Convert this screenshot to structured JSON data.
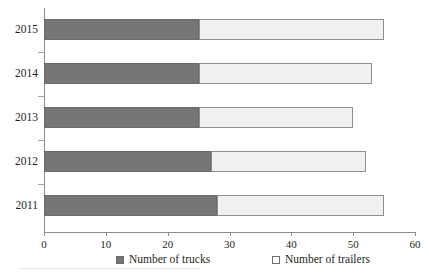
{
  "chart_data": {
    "type": "bar",
    "orientation": "horizontal",
    "stacked": true,
    "title": "",
    "xlabel": "",
    "ylabel": "",
    "categories": [
      "2015",
      "2014",
      "2013",
      "2012",
      "2011"
    ],
    "series": [
      {
        "name": "Number of trucks",
        "values": [
          25,
          25,
          25,
          27,
          28
        ],
        "color": "#767676"
      },
      {
        "name": "Number of trailers",
        "values": [
          30,
          28,
          25,
          25,
          27
        ],
        "color": "#f0f0f0"
      }
    ],
    "totals": [
      55,
      53,
      50,
      52,
      55
    ],
    "xlim": [
      0,
      60
    ],
    "xticks": [
      "0",
      "10",
      "20",
      "30",
      "40",
      "50",
      "60"
    ],
    "xtick_values": [
      0,
      10,
      20,
      30,
      40,
      50,
      60
    ],
    "grid": false,
    "legend_position": "bottom"
  },
  "legend": {
    "items": [
      {
        "label": "Number of trucks",
        "swatch": "filled-dark-square"
      },
      {
        "label": "Number of trailers",
        "swatch": "outlined-light-square"
      }
    ]
  }
}
